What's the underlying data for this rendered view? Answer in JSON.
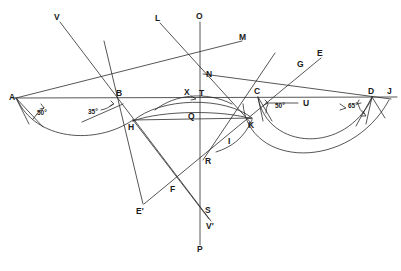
{
  "figure": {
    "caption": "",
    "stroke_color": "#2b2b2b",
    "label_color": "#1a1a1a",
    "background": "#ffffff"
  },
  "points": [
    {
      "id": "A",
      "label": "A",
      "x": 16,
      "y": 98,
      "lx": 10,
      "ly": 97
    },
    {
      "id": "B",
      "label": "B",
      "x": 120,
      "y": 99,
      "lx": 117,
      "ly": 95
    },
    {
      "id": "C",
      "label": "C",
      "x": 258,
      "y": 97,
      "lx": 255,
      "ly": 93
    },
    {
      "id": "D",
      "label": "D",
      "x": 372,
      "y": 97,
      "lx": 369,
      "ly": 93
    },
    {
      "id": "J",
      "label": "J",
      "x": 391,
      "y": 97,
      "lx": 388,
      "ly": 93
    },
    {
      "id": "H",
      "label": "H",
      "x": 133,
      "y": 120,
      "lx": 129,
      "ly": 127
    },
    {
      "id": "K",
      "label": "K",
      "x": 250,
      "y": 120,
      "lx": 249,
      "ly": 127
    },
    {
      "id": "N",
      "label": "N",
      "x": 203,
      "y": 74,
      "lx": 206,
      "ly": 74
    },
    {
      "id": "X",
      "label": "X",
      "x": 189,
      "y": 92,
      "lx": 186,
      "ly": 92
    },
    {
      "id": "T",
      "label": "T",
      "x": 203,
      "y": 93,
      "lx": 200,
      "ly": 93
    },
    {
      "id": "Q",
      "label": "Q",
      "x": 193,
      "y": 115,
      "lx": 190,
      "ly": 117
    },
    {
      "id": "I",
      "label": "I",
      "x": 231,
      "y": 137,
      "lx": 229,
      "ly": 141
    },
    {
      "id": "R",
      "label": "R",
      "x": 203,
      "y": 160,
      "lx": 205,
      "ly": 162
    },
    {
      "id": "F",
      "label": "F",
      "x": 171,
      "y": 186,
      "lx": 172,
      "ly": 189
    },
    {
      "id": "S",
      "label": "S",
      "x": 203,
      "y": 209,
      "lx": 205,
      "ly": 211
    },
    {
      "id": "G",
      "label": "G",
      "x": 301,
      "y": 66,
      "lx": 298,
      "ly": 64
    },
    {
      "id": "E",
      "label": "E",
      "x": 321,
      "y": 56,
      "lx": 318,
      "ly": 54
    },
    {
      "id": "V",
      "label": "V",
      "x": 59,
      "y": 19,
      "lx": 55,
      "ly": 17
    },
    {
      "id": "L",
      "label": "L",
      "x": 159,
      "y": 20,
      "lx": 156,
      "ly": 18
    },
    {
      "id": "O",
      "label": "O",
      "x": 200,
      "y": 19,
      "lx": 197,
      "ly": 16
    },
    {
      "id": "M",
      "label": "M",
      "x": 242,
      "y": 38,
      "lx": 240,
      "ly": 37
    },
    {
      "id": "U",
      "label": "U",
      "x": 302,
      "y": 105,
      "lx": 303,
      "ly": 106
    },
    {
      "id": "P",
      "label": "P",
      "x": 200,
      "y": 247,
      "lx": 198,
      "ly": 249
    },
    {
      "id": "E'",
      "label": "E'",
      "x": 143,
      "y": 206,
      "lx": 138,
      "ly": 211
    },
    {
      "id": "V'",
      "label": "V'",
      "x": 209,
      "y": 221,
      "lx": 207,
      "ly": 226
    }
  ],
  "angles": [
    {
      "id": "angle-A",
      "label": "50°",
      "at": "A",
      "lx": 37,
      "ly": 113
    },
    {
      "id": "angle-B",
      "label": "35°",
      "at": "B",
      "lx": 91,
      "ly": 112
    },
    {
      "id": "angle-C",
      "label": "50°",
      "at": "C",
      "lx": 276,
      "ly": 107
    },
    {
      "id": "angle-D",
      "label": "65°",
      "at": "D",
      "lx": 351,
      "ly": 107
    }
  ],
  "segments": [
    {
      "id": "baseline-AJ",
      "from": "A",
      "to": "J"
    },
    {
      "id": "line-V-to-F",
      "from": "V",
      "to": "F"
    },
    {
      "id": "line-A-to-M",
      "from": "A",
      "to": "M"
    },
    {
      "id": "line-L-to-K",
      "from": "L",
      "to": "K"
    },
    {
      "id": "line-O-to-P",
      "from": "O",
      "to": "P"
    },
    {
      "id": "line-H-to-Vprime",
      "from": "H",
      "to": "V'"
    },
    {
      "id": "line-Eprime-to-E",
      "from": "E'",
      "to": "E"
    },
    {
      "id": "line-G-to-I",
      "from": "G",
      "to": "I"
    },
    {
      "id": "chord-H-to-Q-to-K",
      "from": "H",
      "to": "K"
    },
    {
      "id": "line-D-to-N",
      "from": "D",
      "to": "N"
    }
  ],
  "arcs": [
    {
      "id": "arc-A-to-H",
      "note": "lower arc left, A down through bottom to H"
    },
    {
      "id": "arc-H-to-K-upper",
      "note": "shallow upper arc H to K through X/T"
    },
    {
      "id": "arc-H-to-K-lower",
      "note": "shallow lower arc H to K"
    },
    {
      "id": "arc-C-to-D-inner",
      "note": "inner right arc C down to D"
    },
    {
      "id": "arc-K-to-J-outer",
      "note": "outer right arc K down to near J"
    }
  ]
}
